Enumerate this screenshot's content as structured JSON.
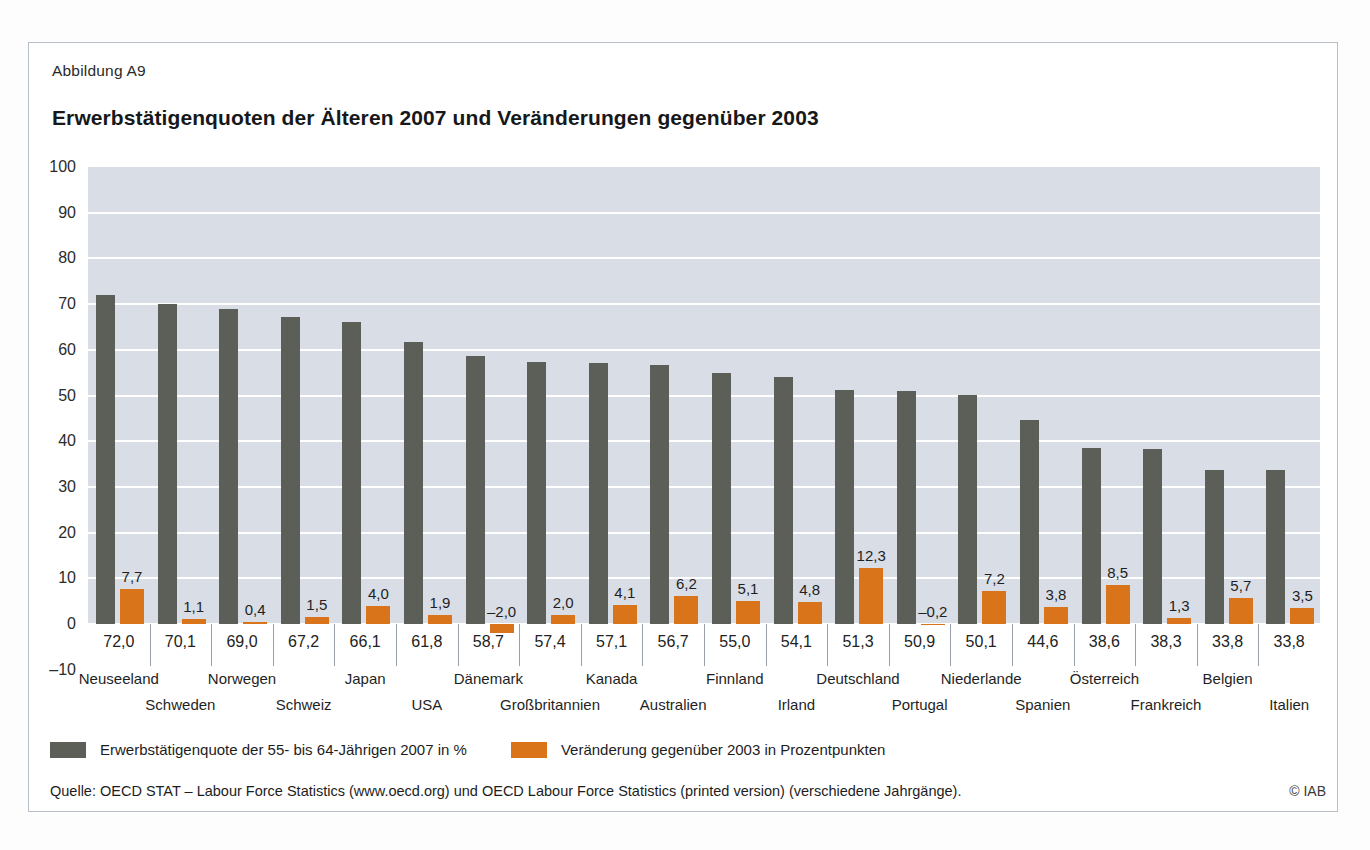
{
  "figure": {
    "label": "Abbildung A9",
    "title": "Erwerbstätigenquoten der Älteren 2007 und Veränderungen gegenüber 2003",
    "source": "Quelle: OECD STAT – Labour Force Statistics (www.oecd.org) und OECD Labour Force Statistics (printed version) (verschiedene Jahrgänge).",
    "copyright": "© IAB"
  },
  "legend": {
    "position": "bottom",
    "items": [
      {
        "label": "Erwerbstätigenquote der 55- bis 64-Jährigen 2007 in %",
        "color": "#5c5e58"
      },
      {
        "label": "Veränderung gegenüber 2003 in Prozentpunkten",
        "color": "#d9741a"
      }
    ]
  },
  "chart_data": {
    "type": "bar",
    "title": "Erwerbstätigenquoten der Älteren 2007 und Veränderungen gegenüber 2003",
    "xlabel": "",
    "ylabel": "",
    "ylim": [
      -10,
      100
    ],
    "ytick_step": 10,
    "yticks": [
      "100",
      "90",
      "80",
      "70",
      "60",
      "50",
      "40",
      "30",
      "20",
      "10",
      "0",
      "-10"
    ],
    "grid": true,
    "categories": [
      "Neuseeland",
      "Schweden",
      "Norwegen",
      "Schweiz",
      "Japan",
      "USA",
      "Dänemark",
      "Großbritannien",
      "Kanada",
      "Australien",
      "Finnland",
      "Irland",
      "Deutschland",
      "Portugal",
      "Niederlande",
      "Spanien",
      "Österreich",
      "Frankreich",
      "Belgien",
      "Italien"
    ],
    "series": [
      {
        "name": "Erwerbstätigenquote der 55- bis 64-Jährigen 2007 in %",
        "color": "#5c5e58",
        "values": [
          72.0,
          70.1,
          69.0,
          67.2,
          66.1,
          61.8,
          58.7,
          57.4,
          57.1,
          56.7,
          55.0,
          54.1,
          51.3,
          50.9,
          50.1,
          44.6,
          38.6,
          38.3,
          33.8,
          33.8
        ],
        "labels": [
          "72,0",
          "70,1",
          "69,0",
          "67,2",
          "66,1",
          "61,8",
          "58,7",
          "57,4",
          "57,1",
          "56,7",
          "55,0",
          "54,1",
          "51,3",
          "50,9",
          "50,1",
          "44,6",
          "38,6",
          "38,3",
          "33,8",
          "33,8"
        ]
      },
      {
        "name": "Veränderung gegenüber 2003 in Prozentpunkten",
        "color": "#d9741a",
        "values": [
          7.7,
          1.1,
          0.4,
          1.5,
          4.0,
          1.9,
          -2.0,
          2.0,
          4.1,
          6.2,
          5.1,
          4.8,
          12.3,
          -0.2,
          7.2,
          3.8,
          8.5,
          1.3,
          5.7,
          3.5
        ],
        "labels": [
          "7,7",
          "1,1",
          "0,4",
          "1,5",
          "4,0",
          "1,9",
          "-2,0",
          "2,0",
          "4,1",
          "6,2",
          "5,1",
          "4,8",
          "12,3",
          "-0,2",
          "7,2",
          "3,8",
          "8,5",
          "1,3",
          "5,7",
          "3,5"
        ]
      }
    ]
  }
}
